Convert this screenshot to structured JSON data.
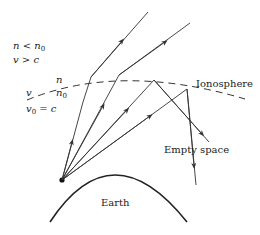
{
  "diagram": {
    "labels": {
      "ionosphere": "Ionosphere",
      "empty_space": "Empty space",
      "earth": "Earth"
    },
    "conditions_upper": {
      "line1": {
        "var": "n",
        "op": "<",
        "rhs": "n",
        "rhs_sub": "0"
      },
      "line2": {
        "var": "v",
        "op": ">",
        "rhs": "c"
      }
    },
    "boundary_labels": {
      "n_above": "n",
      "n0_below": "n",
      "n0_sub": "0",
      "v": "v",
      "v0": "v",
      "v0_sub": "0",
      "v0_eq": "= c"
    },
    "colors": {
      "line": "#333333",
      "text": "#222222",
      "background": "#ffffff"
    },
    "rays": [
      {
        "name": "ray-1",
        "behavior": "transmitted"
      },
      {
        "name": "ray-2",
        "behavior": "transmitted"
      },
      {
        "name": "ray-3",
        "behavior": "reflected"
      },
      {
        "name": "ray-4",
        "behavior": "reflected"
      }
    ]
  }
}
